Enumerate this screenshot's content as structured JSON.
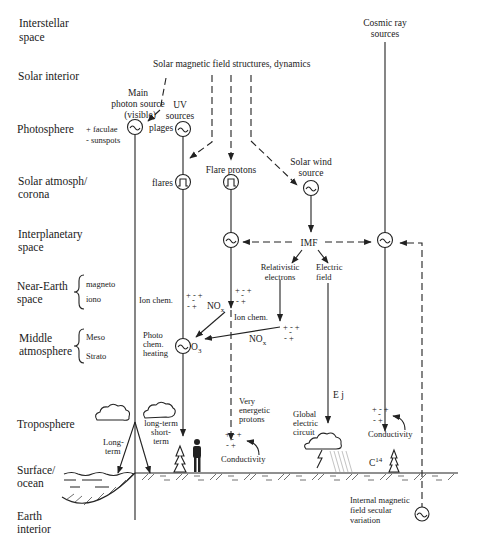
{
  "levels": [
    {
      "line1": "Interstellar",
      "line2": "space"
    },
    {
      "line1": "Solar interior",
      "line2": ""
    },
    {
      "line1": "Photosphere",
      "line2": ""
    },
    {
      "line1": "Solar atmosph/",
      "line2": "corona"
    },
    {
      "line1": "Interplanetary",
      "line2": "space"
    },
    {
      "line1": "Near-Earth",
      "line2": "space"
    },
    {
      "line1": "Middle",
      "line2": "atmosphere"
    },
    {
      "line1": "Troposphere",
      "line2": ""
    },
    {
      "line1": "Surface/",
      "line2": "ocean"
    },
    {
      "line1": "Earth",
      "line2": "interior"
    }
  ],
  "sublevels": {
    "near_earth": [
      "magneto",
      "iono"
    ],
    "middle_atm": [
      "Meso",
      "Strato"
    ]
  },
  "sources": {
    "solar_field": "Solar magnetic field structures, dynamics",
    "cosmic_ray": [
      "Cosmic ray",
      "sources"
    ],
    "main_photon": [
      "Main",
      "photon source",
      "(visible)"
    ],
    "uv": [
      "UV",
      "sources"
    ],
    "faculae": "+ faculae",
    "sunspots": "-  sunspots",
    "plages": "plages",
    "flares": "flares",
    "flare_protons": "Flare protons",
    "solar_wind": [
      "Solar wind",
      "source"
    ],
    "imf": "IMF"
  },
  "processes": {
    "relativistic": [
      "Relativistic",
      "electrons"
    ],
    "electric_field": [
      "Electric",
      "field"
    ],
    "ion_chem_1": "Ion  chem.",
    "ion_chem_2": "Ion  chem.",
    "nox_1": "NO",
    "nox_2": "NO",
    "nox_sub": "x",
    "o3": "O",
    "o3_sub": "3",
    "photochem": [
      "Photo",
      "chem.",
      "heating"
    ],
    "ej": "E j",
    "very_energetic": [
      "Very",
      "energetic",
      "protons"
    ],
    "conductivity_1": "Conductivity",
    "conductivity_2": "Conductivity",
    "global_circuit": [
      "Global",
      "electric",
      "circuit"
    ],
    "long_term": [
      "Long-",
      "term"
    ],
    "long_short": [
      "long-term",
      "short-",
      "term"
    ],
    "c14": "C",
    "c14_sup": "14",
    "internal_field": [
      "Internal magnetic",
      "field secular",
      "variation"
    ],
    "ions_top": "+ - +",
    "ions_mid": "-",
    "ions_bot": "-  +"
  }
}
